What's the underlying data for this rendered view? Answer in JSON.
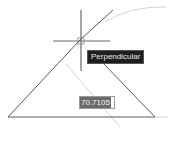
{
  "drawing": {
    "triangle": {
      "points": [
        [
          8,
          117
        ],
        [
          155,
          117
        ],
        [
          80,
          40
        ]
      ],
      "stroke": "#5a5a5a"
    },
    "extension_line": {
      "from": [
        80,
        40
      ],
      "to": [
        113,
        10
      ]
    },
    "crosshair": {
      "center": [
        81,
        41
      ],
      "size": 30,
      "color": "#6a6a6a"
    },
    "construction_color": "#d4d4d4"
  },
  "snap_tooltip": {
    "label": "Perpendicular"
  },
  "dynamic_input": {
    "value": "70.7105"
  },
  "colors": {
    "background": "#ffffff",
    "geometry": "#5a5a5a",
    "tooltip_bg": "#1e1e1e",
    "input_highlight": "#6b6b6b"
  }
}
